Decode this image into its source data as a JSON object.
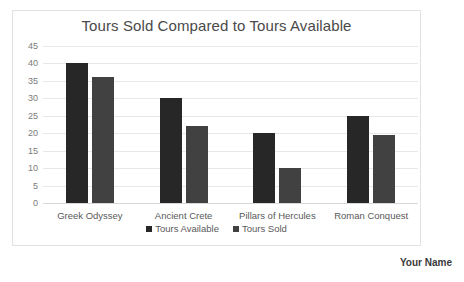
{
  "chart_data": {
    "type": "bar",
    "title": "Tours Sold Compared to Tours Available",
    "xlabel": "",
    "ylabel": "",
    "ylim": [
      0,
      45
    ],
    "ytick_step": 5,
    "yticks": [
      45,
      40,
      35,
      30,
      25,
      20,
      15,
      10,
      5,
      0
    ],
    "grid": true,
    "legend_position": "bottom",
    "categories": [
      "Greek Odyssey",
      "Ancient Crete",
      "Pillars of Hercules",
      "Roman Conquest"
    ],
    "series": [
      {
        "name": "Tours Available",
        "color": "#272727",
        "values": [
          40,
          30,
          20,
          25
        ]
      },
      {
        "name": "Tours Sold",
        "color": "#414141",
        "values": [
          36,
          22,
          10,
          19.5
        ]
      }
    ]
  },
  "footer": {
    "name": "Your Name"
  }
}
